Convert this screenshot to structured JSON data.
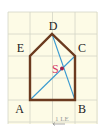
{
  "diagram": {
    "grid": {
      "x0": 8,
      "y0": 12,
      "cell": 22.3,
      "cols": 4,
      "rows": 5,
      "bg": "#fdfbe6",
      "line": "#d3d6c6"
    },
    "points": {
      "A": {
        "label": "A",
        "x": 30,
        "y": 100
      },
      "B": {
        "label": "B",
        "x": 75,
        "y": 100
      },
      "C": {
        "label": "C",
        "x": 75,
        "y": 56
      },
      "D": {
        "label": "D",
        "x": 52,
        "y": 34
      },
      "E": {
        "label": "E",
        "x": 30,
        "y": 56
      },
      "S": {
        "label": "S",
        "x": 62,
        "y": 69
      }
    },
    "polygon_color": "#6b3a1f",
    "diagonal_color": "#3a9ad0",
    "s_color": "#d63a66",
    "point_dot_color": "#a0204a",
    "scale_label": "1 LE"
  }
}
